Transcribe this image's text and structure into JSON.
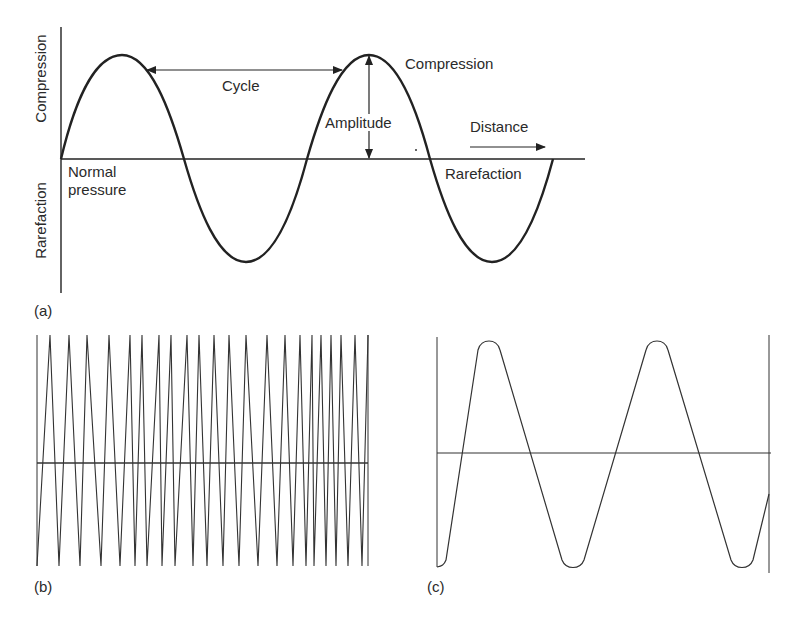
{
  "panel_a": {
    "tag": "(a)",
    "y_axis_labels": {
      "top": "Compression",
      "bottom": "Rarefaction"
    },
    "baseline_label_line1": "Normal",
    "baseline_label_line2": "pressure",
    "cycle_label": "Cycle",
    "amplitude_label": "Amplitude",
    "compression_label": "Compression",
    "rarefaction_label": "Rarefaction",
    "distance_label": "Distance",
    "waveform": "sine",
    "cycles_shown": 2
  },
  "panel_b": {
    "tag": "(b)",
    "waveform": "triangle (high frequency)",
    "peaks_approx_x": [
      50,
      69,
      87,
      109,
      130,
      142,
      159,
      171,
      187,
      199,
      214,
      229,
      246,
      267,
      285,
      300,
      321,
      331,
      341,
      355,
      368
    ]
  },
  "panel_c": {
    "tag": "(c)",
    "waveform": "rounded triangle (low frequency)",
    "cycles_shown": 2
  },
  "colors": {
    "line": "#222222",
    "background": "#ffffff"
  }
}
